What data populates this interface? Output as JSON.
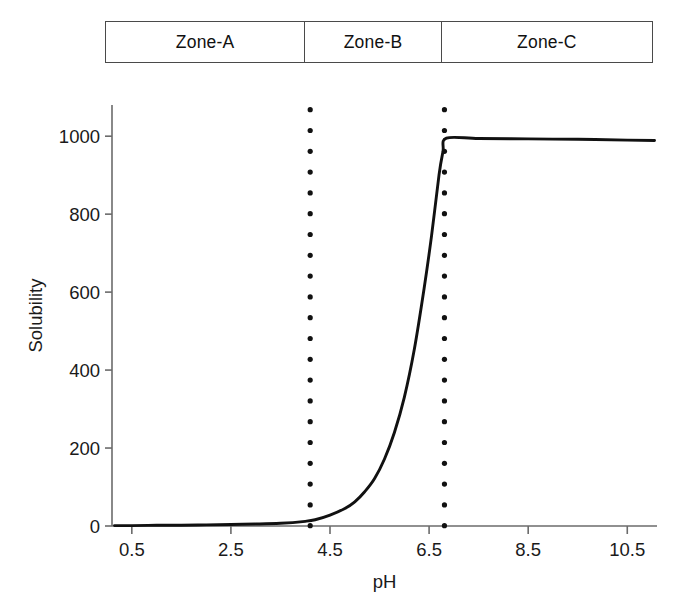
{
  "zones": {
    "cells": [
      {
        "label": "Zone-A",
        "id": "zone-a"
      },
      {
        "label": "Zone-B",
        "id": "zone-b"
      },
      {
        "label": "Zone-C",
        "id": "zone-c"
      }
    ]
  },
  "chart_data": {
    "type": "line",
    "title": "",
    "xlabel": "pH",
    "ylabel": "Solubility",
    "xlim": [
      0.1,
      11.1
    ],
    "ylim": [
      0,
      1080
    ],
    "grid": false,
    "legend_position": "none",
    "xticks": [
      0.5,
      2.5,
      4.5,
      6.5,
      8.5,
      10.5
    ],
    "xtick_labels": [
      "0.5",
      "2.5",
      "4.5",
      "6.5",
      "8.5",
      "10.5"
    ],
    "yticks": [
      0,
      200,
      400,
      600,
      800,
      1000
    ],
    "ytick_labels": [
      "0",
      "200",
      "400",
      "600",
      "800",
      "1000"
    ],
    "series": [
      {
        "name": "Solubility vs pH",
        "style": "solid",
        "color": "#111111",
        "x": [
          0.15,
          0.5,
          1.0,
          1.5,
          2.0,
          2.5,
          3.0,
          3.5,
          4.0,
          4.2,
          4.5,
          4.8,
          5.0,
          5.2,
          5.4,
          5.6,
          5.8,
          6.0,
          6.2,
          6.4,
          6.55,
          6.7,
          6.78,
          6.85,
          7.5,
          8.5,
          9.5,
          10.5,
          11.05
        ],
        "y": [
          1,
          1,
          2,
          2,
          3,
          4,
          5,
          7,
          12,
          16,
          28,
          45,
          62,
          88,
          122,
          172,
          240,
          330,
          452,
          610,
          745,
          900,
          960,
          995,
          994,
          993,
          992,
          990,
          989
        ]
      }
    ],
    "vertical_markers": [
      {
        "name": "zone-a-b-boundary",
        "x": 4.1,
        "y_from": 0,
        "y_to": 1068,
        "style": "dotted",
        "color": "#111111"
      },
      {
        "name": "zone-b-c-boundary",
        "x": 6.81,
        "y_from": 0,
        "y_to": 1068,
        "style": "dotted",
        "color": "#111111"
      }
    ],
    "axis_color": "#6b6b6b",
    "plateau_value": 995,
    "baseline_value": 1
  }
}
